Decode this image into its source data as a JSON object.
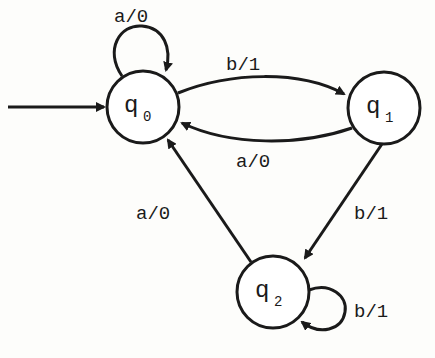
{
  "diagram": {
    "type": "Mealy machine state diagram",
    "states": [
      {
        "id": "q0",
        "name": "q",
        "subscript": "0",
        "initial": true
      },
      {
        "id": "q1",
        "name": "q",
        "subscript": "1",
        "initial": false
      },
      {
        "id": "q2",
        "name": "q",
        "subscript": "2",
        "initial": false
      }
    ],
    "transitions": [
      {
        "from": "q0",
        "to": "q0",
        "label": "a/0"
      },
      {
        "from": "q0",
        "to": "q1",
        "label": "b/1"
      },
      {
        "from": "q1",
        "to": "q0",
        "label": "a/0"
      },
      {
        "from": "q1",
        "to": "q2",
        "label": "b/1"
      },
      {
        "from": "q2",
        "to": "q0",
        "label": "a/0"
      },
      {
        "from": "q2",
        "to": "q2",
        "label": "b/1"
      }
    ]
  }
}
